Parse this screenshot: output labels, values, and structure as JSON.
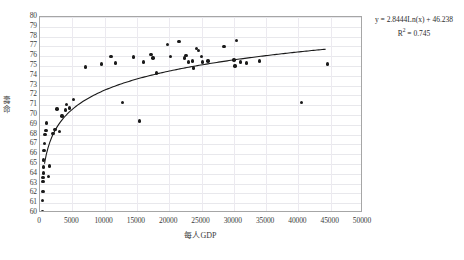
{
  "chart_data": {
    "type": "scatter",
    "title": "",
    "xlabel": "每人GDP",
    "ylabel": "壽命",
    "xlim": [
      0,
      50000
    ],
    "ylim": [
      60,
      80
    ],
    "xticks": [
      0,
      5000,
      10000,
      15000,
      20000,
      25000,
      30000,
      35000,
      40000,
      45000,
      50000
    ],
    "yticks": [
      60,
      61,
      62,
      63,
      64,
      65,
      66,
      67,
      68,
      69,
      70,
      71,
      72,
      73,
      74,
      75,
      76,
      77,
      78,
      79,
      80
    ],
    "grid": true,
    "legend": false,
    "marker_color": "#1a1a1a",
    "trendline_color": "#1a1a1a",
    "gridline_color": "#e8e8ec",
    "frame_color": "#a6a6a6",
    "annotations": {
      "equation": "y = 2.8444Ln(x) + 46.238",
      "r_squared_prefix": "R",
      "r_squared_exponent": "2",
      "r_squared_value": " = 0.745"
    },
    "trendline": {
      "type": "logarithmic",
      "slope": 2.8444,
      "intercept": 46.238,
      "r_squared": 0.745,
      "x_start": 700,
      "x_end": 44500
    },
    "points": [
      [
        420,
        60.1
      ],
      [
        430,
        61.3
      ],
      [
        450,
        62.2
      ],
      [
        470,
        63.2
      ],
      [
        480,
        63.6
      ],
      [
        500,
        64.1
      ],
      [
        520,
        64.7
      ],
      [
        560,
        65.4
      ],
      [
        600,
        66.4
      ],
      [
        700,
        67.1
      ],
      [
        800,
        68.0
      ],
      [
        900,
        68.4
      ],
      [
        1000,
        69.2
      ],
      [
        1300,
        63.7
      ],
      [
        1500,
        64.8
      ],
      [
        2000,
        68.1
      ],
      [
        2300,
        68.5
      ],
      [
        2600,
        70.6
      ],
      [
        3000,
        68.3
      ],
      [
        3400,
        69.9
      ],
      [
        3900,
        70.5
      ],
      [
        4100,
        71.1
      ],
      [
        4600,
        70.7
      ],
      [
        5200,
        71.6
      ],
      [
        7000,
        74.9
      ],
      [
        9500,
        75.2
      ],
      [
        11000,
        76.0
      ],
      [
        11700,
        75.3
      ],
      [
        12800,
        71.3
      ],
      [
        14500,
        75.9
      ],
      [
        15400,
        69.4
      ],
      [
        16000,
        75.4
      ],
      [
        17200,
        76.2
      ],
      [
        17500,
        75.8
      ],
      [
        18000,
        74.3
      ],
      [
        19700,
        77.2
      ],
      [
        20200,
        76.0
      ],
      [
        21500,
        77.5
      ],
      [
        22400,
        75.8
      ],
      [
        22600,
        76.1
      ],
      [
        23000,
        75.4
      ],
      [
        23600,
        75.5
      ],
      [
        23800,
        74.8
      ],
      [
        24200,
        76.8
      ],
      [
        24500,
        76.6
      ],
      [
        25000,
        76.0
      ],
      [
        25200,
        75.4
      ],
      [
        26000,
        75.5
      ],
      [
        28500,
        77.0
      ],
      [
        30000,
        75.6
      ],
      [
        30200,
        75.0
      ],
      [
        30400,
        77.6
      ],
      [
        31000,
        75.4
      ],
      [
        32000,
        75.3
      ],
      [
        34000,
        75.5
      ],
      [
        40500,
        71.3
      ],
      [
        44500,
        75.2
      ]
    ]
  }
}
